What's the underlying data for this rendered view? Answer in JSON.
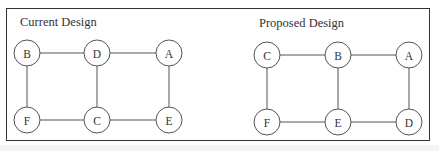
{
  "diagrams": [
    {
      "title": "Current Design",
      "title_pos": {
        "x": 20,
        "y": 15
      },
      "nodes": [
        {
          "id": "B",
          "label": "B",
          "x": 27,
          "y": 53
        },
        {
          "id": "D",
          "label": "D",
          "x": 97,
          "y": 53
        },
        {
          "id": "A",
          "label": "A",
          "x": 169,
          "y": 53
        },
        {
          "id": "F",
          "label": "F",
          "x": 27,
          "y": 120
        },
        {
          "id": "C",
          "label": "C",
          "x": 97,
          "y": 120
        },
        {
          "id": "E",
          "label": "E",
          "x": 169,
          "y": 120
        }
      ],
      "edges": [
        [
          "B",
          "D"
        ],
        [
          "D",
          "A"
        ],
        [
          "B",
          "F"
        ],
        [
          "D",
          "C"
        ],
        [
          "A",
          "E"
        ],
        [
          "F",
          "C"
        ],
        [
          "C",
          "E"
        ]
      ]
    },
    {
      "title": "Proposed Design",
      "title_pos": {
        "x": 259,
        "y": 16
      },
      "nodes": [
        {
          "id": "C",
          "label": "C",
          "x": 267,
          "y": 55
        },
        {
          "id": "B",
          "label": "B",
          "x": 338,
          "y": 55
        },
        {
          "id": "A",
          "label": "A",
          "x": 409,
          "y": 55
        },
        {
          "id": "F",
          "label": "F",
          "x": 267,
          "y": 122
        },
        {
          "id": "E",
          "label": "E",
          "x": 338,
          "y": 122
        },
        {
          "id": "D",
          "label": "D",
          "x": 409,
          "y": 122
        }
      ],
      "edges": [
        [
          "C",
          "B"
        ],
        [
          "B",
          "A"
        ],
        [
          "C",
          "F"
        ],
        [
          "B",
          "E"
        ],
        [
          "A",
          "D"
        ],
        [
          "F",
          "E"
        ],
        [
          "E",
          "D"
        ]
      ]
    }
  ],
  "node_radius": 13
}
